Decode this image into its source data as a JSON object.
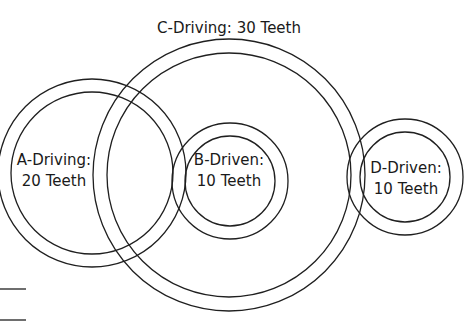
{
  "diagram": {
    "title_label": "C-Driving: 30 Teeth",
    "gears": [
      {
        "id": "A",
        "role": "Driving",
        "teeth": 20,
        "line1": "A-Driving:",
        "line2": "20 Teeth"
      },
      {
        "id": "B",
        "role": "Driven",
        "teeth": 10,
        "line1": "B-Driven:",
        "line2": "10 Teeth"
      },
      {
        "id": "C",
        "role": "Driving",
        "teeth": 30,
        "line1": "C-Driving: 30 Teeth"
      },
      {
        "id": "D",
        "role": "Driven",
        "teeth": 10,
        "line1": "D-Driven:",
        "line2": "10 Teeth"
      }
    ],
    "stroke_color": "#1f1f1f",
    "background_color": "#ffffff"
  }
}
